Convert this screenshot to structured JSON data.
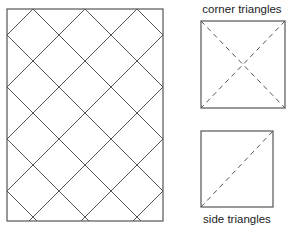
{
  "diagram": {
    "quilt_layout": {
      "description": "Rectangle filled with on-point square blocks (diamond lattice)",
      "blocks_across": 3,
      "blocks_down": 4,
      "line_color": "#555555"
    },
    "corner_triangles": {
      "label": "corner triangles",
      "cut": "square cut twice diagonally (X)",
      "dash_color": "#555555"
    },
    "side_triangles": {
      "label": "side triangles",
      "cut": "square cut once diagonally",
      "dash_color": "#555555"
    }
  }
}
